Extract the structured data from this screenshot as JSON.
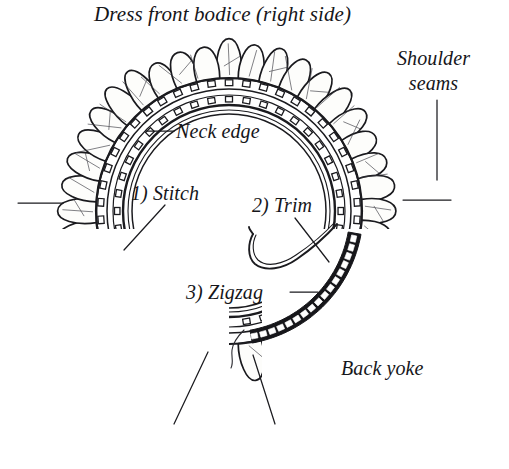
{
  "figure": {
    "type": "technical-sewing-illustration",
    "background_color": "#ffffff",
    "ink_color": "#16161a"
  },
  "title": {
    "text": "Dress front bodice (right side)"
  },
  "labels": {
    "shoulder_seams": {
      "line1": "Shoulder",
      "line2": "seams"
    },
    "neck_edge": "Neck edge",
    "step_1": "1) Stitch",
    "step_2": "2) Trim",
    "step_3": "3) Zigzag",
    "back_yoke": "Back yoke"
  },
  "leaders": [
    {
      "name": "neck-edge-leader",
      "kind": "dash-left"
    },
    {
      "name": "shoulder-seams-leader",
      "kind": "vertical"
    },
    {
      "name": "stitch-leader",
      "kind": "diagonal-down-left"
    },
    {
      "name": "trim-leader",
      "kind": "diagonal-down-right"
    },
    {
      "name": "zigzag-leader",
      "kind": "dash-right"
    },
    {
      "name": "left-edge-leader",
      "kind": "horizontal"
    },
    {
      "name": "right-edge-leader",
      "kind": "horizontal"
    },
    {
      "name": "bottom-left-leader",
      "kind": "diagonal-down-left"
    },
    {
      "name": "bottom-right-leader",
      "kind": "diagonal-down-right"
    }
  ],
  "drawing_elements": {
    "neck_opening": "inner smooth neck edge circle",
    "stitch_band": "concentric band of small square stitch marks",
    "zigzag_band": "dark filled band with white square marks along lower right",
    "ruffle": "scalloped gathered fabric tabs around outer edge",
    "needle": "curved sewing needle near step 2",
    "opening_gap": "gap at bottom center where the two ends meet"
  }
}
